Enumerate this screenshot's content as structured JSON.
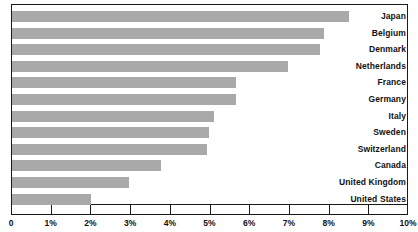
{
  "chart_data": {
    "type": "bar",
    "orientation": "horizontal",
    "title": "",
    "subtitle": "",
    "xlabel": "",
    "ylabel": "",
    "xlim": [
      0,
      10
    ],
    "ylim": null,
    "grid": false,
    "legend": null,
    "legend_position": "none",
    "unit": "%",
    "bar_color": "#a9a9a9",
    "axis_color": "#1a1a1a",
    "text_color": "#111111",
    "categories": [
      "Japan",
      "Belgium",
      "Denmark",
      "Netherlands",
      "France",
      "Germany",
      "Italy",
      "Sweden",
      "Switzerland",
      "Canada",
      "United Kingdom",
      "United States"
    ],
    "values": [
      8.5,
      7.85,
      7.75,
      6.95,
      5.65,
      5.65,
      5.1,
      4.95,
      4.9,
      3.75,
      2.95,
      2.0
    ],
    "xticks": [
      0,
      1,
      2,
      3,
      4,
      5,
      6,
      7,
      8,
      9,
      10
    ],
    "xticklabels": [
      "0",
      "1%",
      "2%",
      "3%",
      "4%",
      "5%",
      "6%",
      "7%",
      "8%",
      "9%",
      "10%"
    ]
  }
}
